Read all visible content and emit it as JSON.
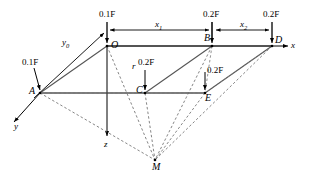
{
  "figure": {
    "type": "structural-load-diagram",
    "axes": {
      "x_label": "x",
      "y_label": "y",
      "z_label": "z"
    },
    "points": [
      {
        "id": "O",
        "label": "O",
        "x": 107,
        "y": 46
      },
      {
        "id": "B",
        "label": "B",
        "x": 212,
        "y": 46
      },
      {
        "id": "D",
        "label": "D",
        "x": 272,
        "y": 46
      },
      {
        "id": "A",
        "label": "A",
        "x": 40,
        "y": 93
      },
      {
        "id": "C",
        "label": "C",
        "x": 145,
        "y": 93
      },
      {
        "id": "E",
        "label": "E",
        "x": 205,
        "y": 93
      },
      {
        "id": "M",
        "label": "M",
        "x": 155,
        "y": 160
      }
    ],
    "loads": [
      {
        "at": "O",
        "value": "0.1F",
        "label_x": 99,
        "label_y": 10
      },
      {
        "at": "B",
        "value": "0.2F",
        "label_x": 203,
        "label_y": 10
      },
      {
        "at": "D",
        "value": "0.2F",
        "label_x": 263,
        "label_y": 10
      },
      {
        "at": "A",
        "value": "0.1F",
        "label_x": 22,
        "label_y": 58
      },
      {
        "at": "C",
        "value": "0.2F",
        "label_x": 138,
        "label_y": 58
      },
      {
        "at": "E",
        "value": "0.2F",
        "label_x": 207,
        "label_y": 66
      }
    ],
    "dimensions": [
      {
        "name": "x1",
        "base": "x",
        "subscript": "1",
        "label_x": 155,
        "label_y": 20
      },
      {
        "name": "x2",
        "base": "x",
        "subscript": "2",
        "label_x": 240,
        "label_y": 20
      },
      {
        "name": "y0",
        "base": "y",
        "subscript": "0",
        "label_x": 62,
        "label_y": 38
      }
    ],
    "annotations": [
      {
        "name": "r",
        "text": "r",
        "label_x": 132,
        "label_y": 62
      }
    ],
    "colors": {
      "line": "#000000",
      "edge": "#555555",
      "dashed": "#666666",
      "background": "#ffffff"
    }
  }
}
